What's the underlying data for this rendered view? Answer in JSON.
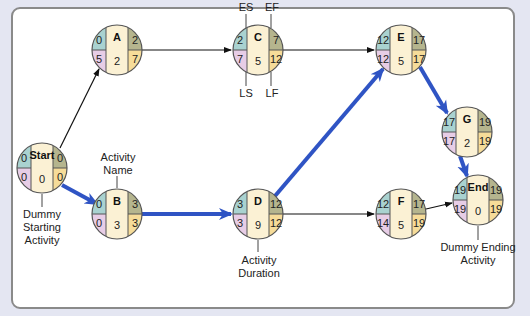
{
  "title_strip": "",
  "colors": {
    "es": "#a9d2d0",
    "ls": "#e7cde6",
    "ef": "#b5b58e",
    "lf": "#f6dc99",
    "center": "#fbf1d4",
    "critical_arrow": "#2f54c4",
    "normal_arrow": "#111111",
    "frame_bg": "#e4e6f2"
  },
  "nodes": [
    {
      "id": "Start",
      "name": "Start",
      "es": "0",
      "ef": "0",
      "ls": "0",
      "lf": "0",
      "duration": "0"
    },
    {
      "id": "A",
      "name": "A",
      "es": "0",
      "ef": "2",
      "ls": "5",
      "lf": "7",
      "duration": "2"
    },
    {
      "id": "B",
      "name": "B",
      "es": "0",
      "ef": "3",
      "ls": "0",
      "lf": "3",
      "duration": "3"
    },
    {
      "id": "C",
      "name": "C",
      "es": "2",
      "ef": "7",
      "ls": "7",
      "lf": "12",
      "duration": "5"
    },
    {
      "id": "D",
      "name": "D",
      "es": "3",
      "ef": "12",
      "ls": "3",
      "lf": "12",
      "duration": "9"
    },
    {
      "id": "E",
      "name": "E",
      "es": "12",
      "ef": "17",
      "ls": "12",
      "lf": "17",
      "duration": "5"
    },
    {
      "id": "F",
      "name": "F",
      "es": "12",
      "ef": "17",
      "ls": "14",
      "lf": "19",
      "duration": "5"
    },
    {
      "id": "G",
      "name": "G",
      "es": "17",
      "ef": "19",
      "ls": "17",
      "lf": "19",
      "duration": "2"
    },
    {
      "id": "End",
      "name": "End",
      "es": "19",
      "ef": "19",
      "ls": "19",
      "lf": "19",
      "duration": "0"
    }
  ],
  "edges": [
    {
      "from": "Start",
      "to": "A",
      "critical": false
    },
    {
      "from": "Start",
      "to": "B",
      "critical": true
    },
    {
      "from": "A",
      "to": "C",
      "critical": false
    },
    {
      "from": "B",
      "to": "D",
      "critical": true
    },
    {
      "from": "C",
      "to": "E",
      "critical": false
    },
    {
      "from": "D",
      "to": "E",
      "critical": true
    },
    {
      "from": "D",
      "to": "F",
      "critical": false
    },
    {
      "from": "E",
      "to": "G",
      "critical": true
    },
    {
      "from": "G",
      "to": "End",
      "critical": true
    },
    {
      "from": "F",
      "to": "End",
      "critical": false
    }
  ],
  "annotations": {
    "es": "ES",
    "ef": "EF",
    "ls": "LS",
    "lf": "LF",
    "activity_name_1": "Activity",
    "activity_name_2": "Name",
    "activity_duration_1": "Activity",
    "activity_duration_2": "Duration",
    "dummy_start_1": "Dummy",
    "dummy_start_2": "Starting",
    "dummy_start_3": "Activity",
    "dummy_end_1": "Dummy Ending",
    "dummy_end_2": "Activity"
  }
}
